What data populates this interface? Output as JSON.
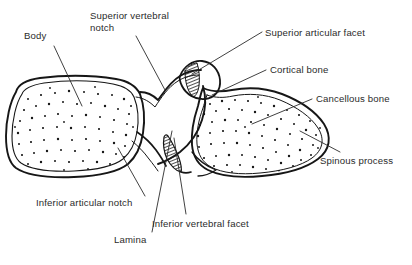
{
  "figure": {
    "background_color": "#ffffff",
    "ink_color": "#1a1a1a",
    "text_color": "#2b2b2b",
    "width": 412,
    "height": 265
  },
  "labels": [
    {
      "id": "body",
      "text": "Body",
      "x": 24,
      "y": 30,
      "leader": {
        "from": [
          54,
          46
        ],
        "to": [
          82,
          106
        ]
      },
      "structure": "vertebral-body"
    },
    {
      "id": "superior-vertebral-notch",
      "text": "Superior vertebral\nnotch",
      "x": 90,
      "y": 10,
      "leader": {
        "from": [
          136,
          36
        ],
        "to": [
          165,
          88
        ]
      },
      "structure": "superior-vertebral-notch"
    },
    {
      "id": "superior-articular-facet",
      "text": "Superior articular facet",
      "x": 265,
      "y": 27,
      "leader": {
        "from": [
          262,
          32
        ],
        "to": [
          192,
          74
        ]
      },
      "structure": "superior-articular-facet"
    },
    {
      "id": "cortical-bone",
      "text": "Cortical bone",
      "x": 270,
      "y": 64,
      "leader": {
        "from": [
          266,
          70
        ],
        "to": [
          212,
          95
        ]
      },
      "structure": "cortical-bone"
    },
    {
      "id": "cancellous-bone",
      "text": "Cancellous bone",
      "x": 316,
      "y": 93,
      "leader": {
        "from": [
          312,
          99
        ],
        "to": [
          252,
          124
        ]
      },
      "structure": "cancellous-bone"
    },
    {
      "id": "spinous-process",
      "text": "Spinous process",
      "x": 320,
      "y": 155,
      "leader": {
        "from": [
          340,
          152
        ],
        "to": [
          300,
          131
        ]
      },
      "structure": "spinous-process"
    },
    {
      "id": "inferior-articular-notch",
      "text": "Inferior articular notch",
      "x": 36,
      "y": 197,
      "leader": {
        "from": [
          145,
          196
        ],
        "to": [
          118,
          148
        ]
      },
      "structure": "inferior-articular-notch"
    },
    {
      "id": "lamina",
      "text": "Lamina",
      "x": 114,
      "y": 234,
      "leader": {
        "from": [
          152,
          232
        ],
        "to": [
          172,
          133
        ]
      },
      "structure": "lamina"
    },
    {
      "id": "inferior-vertebral-facet",
      "text": "Inferior vertebral facet",
      "x": 152,
      "y": 218,
      "leader": {
        "from": [
          186,
          214
        ],
        "to": [
          174,
          140
        ]
      },
      "structure": "inferior-vertebral-facet"
    }
  ],
  "structures": [
    {
      "id": "vertebral-body",
      "name": "Body",
      "fill": "stippled",
      "outline": "double-line"
    },
    {
      "id": "pedicle-region",
      "name": "Pedicle / notch region",
      "fill": "plain",
      "outline": "double-line"
    },
    {
      "id": "superior-articular-facet",
      "name": "Superior articular facet",
      "fill": "hatched",
      "outline": "single-line"
    },
    {
      "id": "inferior-vertebral-facet",
      "name": "Inferior vertebral facet",
      "fill": "hatched",
      "outline": "single-line"
    },
    {
      "id": "spinous-process",
      "name": "Spinous process",
      "fill": "stippled",
      "outline": "double-line"
    }
  ]
}
